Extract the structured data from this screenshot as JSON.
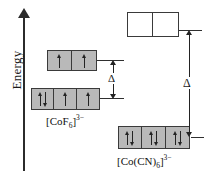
{
  "axis": {
    "label": "Energy",
    "icon": "up-arrow-icon",
    "direction": "up"
  },
  "diagram": {
    "type": "crystal-field-splitting",
    "delta_symbol": "Δ",
    "spin_up_glyph": "↑",
    "spin_down_glyph": "↓",
    "colors": {
      "occupied_box_fill": "#b9b9b9",
      "empty_box_fill": "#ffffff",
      "box_border": "#3a3a3a",
      "ink": "#232323",
      "background": "#ffffff"
    }
  },
  "complexes": [
    {
      "id": "cof6",
      "name": "hexafluoridocobaltate(III)",
      "formula_parts": {
        "open": "[",
        "metal": "Co",
        "ligand": "F",
        "ligand_count": "6",
        "close": "]",
        "charge": "3−"
      },
      "spin_state": "high-spin",
      "delta_label": "Δ",
      "delta_magnitude": "small",
      "upper_level": {
        "name": "eg",
        "box_count": 2,
        "boxes": [
          {
            "electrons": [
              "up"
            ],
            "fill": "occupied"
          },
          {
            "electrons": [
              "up"
            ],
            "fill": "occupied"
          }
        ]
      },
      "lower_level": {
        "name": "t2g",
        "box_count": 3,
        "boxes": [
          {
            "electrons": [
              "up",
              "down"
            ],
            "fill": "occupied"
          },
          {
            "electrons": [
              "up"
            ],
            "fill": "occupied"
          },
          {
            "electrons": [
              "up"
            ],
            "fill": "occupied"
          }
        ]
      }
    },
    {
      "id": "cocn6",
      "name": "hexacyanidocobaltate(III)",
      "formula_parts": {
        "open": "[",
        "metal": "Co",
        "ligand": "(CN)",
        "ligand_count": "6",
        "close": "]",
        "charge": "3−"
      },
      "spin_state": "low-spin",
      "delta_label": "Δ",
      "delta_magnitude": "large",
      "upper_level": {
        "name": "eg",
        "box_count": 2,
        "boxes": [
          {
            "electrons": [],
            "fill": "empty"
          },
          {
            "electrons": [],
            "fill": "empty"
          }
        ]
      },
      "lower_level": {
        "name": "t2g",
        "box_count": 3,
        "boxes": [
          {
            "electrons": [
              "up",
              "down"
            ],
            "fill": "occupied"
          },
          {
            "electrons": [
              "up",
              "down"
            ],
            "fill": "occupied"
          },
          {
            "electrons": [
              "up",
              "down"
            ],
            "fill": "occupied"
          }
        ]
      }
    }
  ],
  "captions": {
    "left": "[CoF6]3−",
    "right": "[Co(CN)6]3−"
  }
}
